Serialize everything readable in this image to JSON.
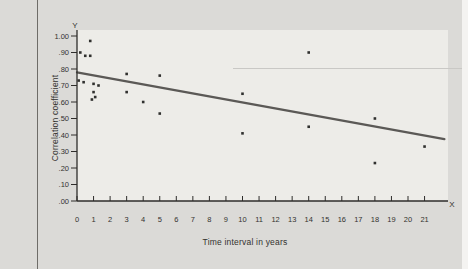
{
  "figure": {
    "y_axis_letter": "Y",
    "x_axis_letter": "X"
  },
  "chart_data": {
    "type": "scatter",
    "title": "",
    "xlabel": "Time interval in years",
    "ylabel": "Correlation coefficient",
    "xlim": [
      0,
      22.4
    ],
    "ylim": [
      0,
      1.0
    ],
    "grid": false,
    "x_ticks": [
      0,
      1,
      2,
      3,
      4,
      5,
      6,
      7,
      8,
      9,
      10,
      11,
      12,
      13,
      14,
      15,
      16,
      17,
      18,
      19,
      20,
      21
    ],
    "y_ticks": [
      {
        "value": 1.0,
        "label": "1.00"
      },
      {
        "value": 0.9,
        "label": ".90"
      },
      {
        "value": 0.8,
        "label": ".80"
      },
      {
        "value": 0.7,
        "label": ".70"
      },
      {
        "value": 0.6,
        "label": ".60"
      },
      {
        "value": 0.5,
        "label": ".50"
      },
      {
        "value": 0.4,
        "label": ".40"
      },
      {
        "value": 0.3,
        "label": ".30"
      },
      {
        "value": 0.2,
        "label": ".20"
      },
      {
        "value": 0.1,
        "label": ".10"
      },
      {
        "value": 0.0,
        "label": ".00"
      }
    ],
    "points": [
      [
        0.8,
        0.97
      ],
      [
        0.2,
        0.9
      ],
      [
        0.5,
        0.88
      ],
      [
        0.8,
        0.88
      ],
      [
        0.1,
        0.73
      ],
      [
        0.4,
        0.72
      ],
      [
        1.0,
        0.71
      ],
      [
        1.3,
        0.7
      ],
      [
        1.0,
        0.66
      ],
      [
        1.1,
        0.63
      ],
      [
        0.9,
        0.615
      ],
      [
        3.0,
        0.77
      ],
      [
        5.0,
        0.76
      ],
      [
        3.0,
        0.66
      ],
      [
        4.0,
        0.6
      ],
      [
        5.0,
        0.53
      ],
      [
        10.0,
        0.65
      ],
      [
        10.0,
        0.41
      ],
      [
        14.0,
        0.9
      ],
      [
        14.0,
        0.45
      ],
      [
        18.0,
        0.5
      ],
      [
        18.0,
        0.23
      ],
      [
        21.0,
        0.33
      ]
    ],
    "trend_line": {
      "x1": 0.0,
      "y1": 0.78,
      "x2": 22.2,
      "y2": 0.375
    },
    "colors": {
      "point": "#30302e",
      "trend": "#5b5956",
      "axis": "#2e2d2b",
      "text": "#33322f",
      "page_bg": "#dbdad7",
      "plot_bg": "#edece8"
    }
  }
}
